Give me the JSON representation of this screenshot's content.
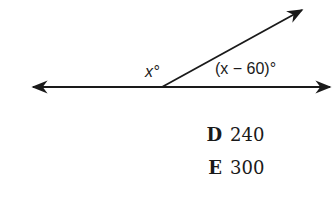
{
  "diagram": {
    "labels": {
      "left_angle": "x°",
      "right_angle": "(x − 60)°"
    },
    "stroke_color": "#1a1a1a"
  },
  "choices": [
    {
      "letter": "D",
      "value": "240"
    },
    {
      "letter": "E",
      "value": "300"
    }
  ]
}
